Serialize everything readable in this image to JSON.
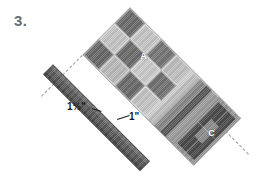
{
  "figure": {
    "step_number": "3.",
    "background_color": "#ffffff"
  },
  "dimensions": [
    {
      "id": "sashing-width",
      "label": "1½\""
    },
    {
      "id": "seam-allowance",
      "label": "1\""
    }
  ],
  "panel": {
    "rotation_deg": 45,
    "section_a": {
      "label": "A",
      "pattern": "checkerboard",
      "light_color": "#c9c9c9",
      "dark_color": "#6f6f6f"
    },
    "section_c": {
      "label": "C",
      "pattern": "square-in-square",
      "outer_color": "#4e4e4e",
      "inner_color": "#8a8a8a"
    },
    "stripe_colors": [
      "#8d8d8d",
      "#5a5a5a",
      "#c4c4c4",
      "#a0a0a0",
      "#6a6a6a",
      "#d2d2d2"
    ]
  },
  "sashing_strip": {
    "name": "detached-sashing-strip",
    "color": "#5d5d5d",
    "highlight_color": "#737373",
    "shadow_color": "#4a4a4a"
  },
  "guides": {
    "style": "dashed",
    "color": "#9a9a9a",
    "count": 2
  }
}
